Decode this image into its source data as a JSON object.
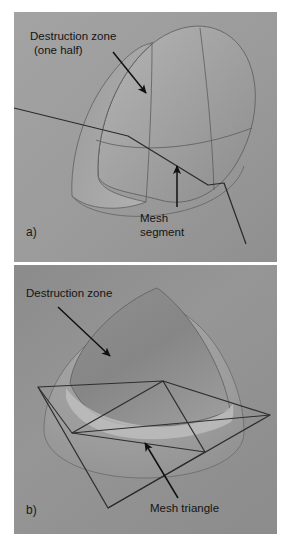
{
  "figure": {
    "background_color": "#ffffff",
    "panel_fill": "#9a9a9a",
    "panel_fill_b": "#8e8e8e",
    "ink_color": "#141414"
  },
  "panels": [
    {
      "id": "a",
      "label": "a)",
      "annotations": [
        {
          "name": "destruction-zone-one-half",
          "line1": "Destruction zone",
          "line2": "(one half)"
        },
        {
          "name": "mesh-segment",
          "line1": "Mesh",
          "line2": "segment"
        }
      ],
      "shapes": {
        "dome": "half-dome",
        "mesh": "polyline-segment"
      }
    },
    {
      "id": "b",
      "label": "b)",
      "annotations": [
        {
          "name": "destruction-zone",
          "line1": "Destruction zone",
          "line2": ""
        },
        {
          "name": "mesh-triangle",
          "line1": "Mesh triangle",
          "line2": ""
        }
      ],
      "shapes": {
        "dome": "paraboloid",
        "mesh": "quad-with-triangle"
      }
    }
  ],
  "colors": {
    "dome_light": "#a6a6a6",
    "dome_dark": "#8a8a8a",
    "dome_shadow": "#7f7f7f",
    "base_highlight": "#b8b8b8",
    "outline": "#4a4a4a",
    "mesh_line": "#2e2e2e",
    "arrow": "#101010"
  }
}
